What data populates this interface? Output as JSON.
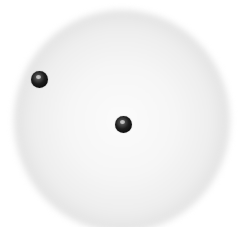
{
  "diagram": {
    "cloud": {
      "shape": "sphere-halo",
      "center_color": "#fbfbfb",
      "rim_color": "#c4c4c4"
    },
    "particles": [
      {
        "id": "outer-particle",
        "x": 39,
        "y": 79,
        "color": "#1a1a1a"
      },
      {
        "id": "central-particle",
        "x": 123,
        "y": 124,
        "color": "#1a1a1a"
      }
    ]
  }
}
